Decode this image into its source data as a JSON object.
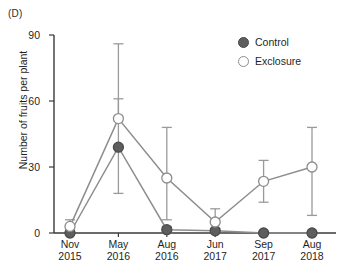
{
  "panel": {
    "label": "(D)"
  },
  "legend": {
    "position": "top-right",
    "entries": [
      {
        "label": "Control",
        "marker": "filled-circle-icon",
        "color": "#5e5e5e"
      },
      {
        "label": "Exclosure",
        "marker": "open-circle-icon",
        "color": "#ffffff"
      }
    ]
  },
  "axes": {
    "y_label": "Number of fruits per plant",
    "y_ticks": [
      "0",
      "30",
      "60",
      "90"
    ],
    "x_ticks": [
      {
        "month": "Nov",
        "year": "2015"
      },
      {
        "month": "May",
        "year": "2016"
      },
      {
        "month": "Aug",
        "year": "2016"
      },
      {
        "month": "Jun",
        "year": "2017"
      },
      {
        "month": "Sep",
        "year": "2017"
      },
      {
        "month": "Aug",
        "year": "2018"
      }
    ]
  },
  "chart_data": {
    "type": "line",
    "title": "(D)",
    "xlabel": "",
    "ylabel": "Number of fruits per plant",
    "ylim": [
      0,
      90
    ],
    "yticks": [
      0,
      30,
      60,
      90
    ],
    "grid": false,
    "legend_position": "top-right",
    "categories": [
      "Nov 2015",
      "May 2016",
      "Aug 2016",
      "Jun 2017",
      "Sep 2017",
      "Aug 2018"
    ],
    "series": [
      {
        "name": "Control",
        "marker": "filled-circle",
        "color": "#5e5e5e",
        "values": [
          0,
          39,
          1.5,
          1,
          0,
          0
        ],
        "err_low": [
          0,
          18,
          0,
          0,
          0,
          0
        ],
        "err_high": [
          0,
          61,
          3,
          2,
          0,
          0
        ]
      },
      {
        "name": "Exclosure",
        "marker": "open-circle",
        "color": "#ffffff",
        "values": [
          3,
          52,
          25,
          5,
          23.5,
          30
        ],
        "err_low": [
          0,
          52,
          6,
          2,
          14,
          8
        ],
        "err_high": [
          6,
          86,
          48,
          11,
          33,
          48
        ]
      }
    ]
  }
}
